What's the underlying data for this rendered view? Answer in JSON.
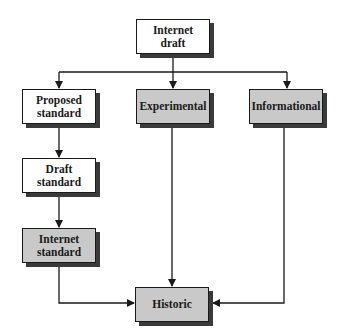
{
  "diagram": {
    "colors": {
      "line": "#1a1a1a",
      "white_fill": "#ffffff",
      "gray_fill": "#c9c9c9",
      "shadow": "#3a3a3a"
    },
    "nodes": {
      "internet_draft": {
        "line1": "Internet",
        "line2": "draft",
        "fill": "white"
      },
      "proposed_standard": {
        "line1": "Proposed",
        "line2": "standard",
        "fill": "white"
      },
      "experimental": {
        "line1": "Experimental",
        "fill": "gray"
      },
      "informational": {
        "line1": "Informational",
        "fill": "gray"
      },
      "draft_standard": {
        "line1": "Draft",
        "line2": "standard",
        "fill": "white"
      },
      "internet_standard": {
        "line1": "Internet",
        "line2": "standard",
        "fill": "gray"
      },
      "historic": {
        "line1": "Historic",
        "fill": "gray"
      }
    },
    "edges": [
      {
        "from": "Internet draft",
        "to": "Proposed standard"
      },
      {
        "from": "Internet draft",
        "to": "Experimental"
      },
      {
        "from": "Internet draft",
        "to": "Informational"
      },
      {
        "from": "Proposed standard",
        "to": "Draft standard"
      },
      {
        "from": "Draft standard",
        "to": "Internet standard"
      },
      {
        "from": "Internet standard",
        "to": "Historic"
      },
      {
        "from": "Experimental",
        "to": "Historic"
      },
      {
        "from": "Informational",
        "to": "Historic"
      }
    ]
  }
}
